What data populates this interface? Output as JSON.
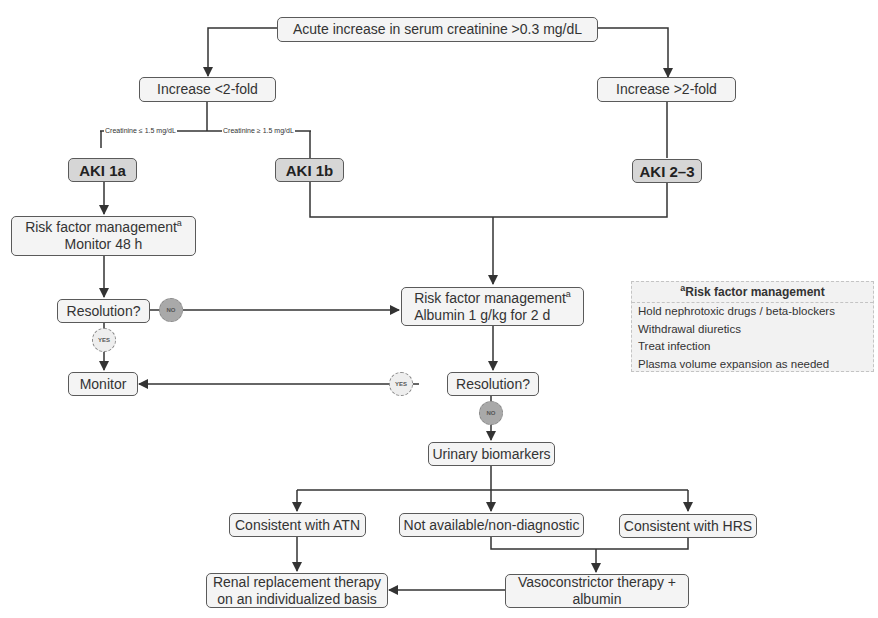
{
  "diagram": {
    "start": "Acute increase in serum creatinine >0.3 mg/dL",
    "left_branch": "Increase <2-fold",
    "right_branch": "Increase >2-fold",
    "cond_low": "Creatinine ≤ 1.5 mg/dL",
    "cond_high": "Creatinine ≥ 1.5 mg/dL",
    "aki_1a": "AKI 1a",
    "aki_1b": "AKI 1b",
    "aki_23": "AKI 2–3",
    "rfm1_line1": "Risk factor management",
    "rfm1_line2": "Monitor 48 h",
    "rfm2_line1": "Risk factor management",
    "rfm2_line2": "Albumin 1 g/kg for 2 d",
    "footnote_mark": "a",
    "resolution1": "Resolution?",
    "resolution2": "Resolution?",
    "monitor": "Monitor",
    "no_label": "NO",
    "yes_label": "YES",
    "urinary": "Urinary biomarkers",
    "atn": "Consistent with ATN",
    "not_available": "Not available/non-diagnostic",
    "hrs": "Consistent with HRS",
    "rrt_line1": "Renal replacement therapy",
    "rrt_line2": "on an individualized basis",
    "vaso_line1": "Vasoconstrictor therapy +",
    "vaso_line2": "albumin"
  },
  "legend": {
    "title_mark": "a",
    "title": "Risk factor management",
    "items": [
      "Hold nephrotoxic drugs /  beta-blockers",
      "Withdrawal diuretics",
      "Treat infection",
      "Plasma volume expansion as needed"
    ]
  },
  "colors": {
    "box_fill": "#f4f4f4",
    "aki_fill": "#d6d6d6",
    "line": "#333333",
    "no_badge": "#a9a9a9",
    "yes_badge": "#eeeeee"
  }
}
